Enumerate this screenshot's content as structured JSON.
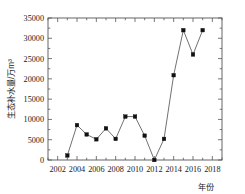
{
  "chart_data": {
    "type": "line",
    "title": "",
    "xlabel": "年份",
    "ylabel": "生态补水量/万m³",
    "x": [
      2003,
      2004,
      2005,
      2006,
      2007,
      2008,
      2009,
      2010,
      2011,
      2012,
      2013,
      2014,
      2015,
      2016,
      2017
    ],
    "values": [
      1100,
      8600,
      6300,
      5100,
      7800,
      5200,
      10700,
      10700,
      6000,
      0,
      5200,
      20900,
      32000,
      26000,
      32000
    ],
    "series": [
      {
        "name": "生态补水量",
        "values": [
          1100,
          8600,
          6300,
          5100,
          7800,
          5200,
          10700,
          10700,
          6000,
          0,
          5200,
          20900,
          32000,
          26000,
          32000
        ]
      }
    ],
    "xlim": [
      2001,
      2019
    ],
    "ylim": [
      0,
      35000
    ],
    "xticks": [
      2002,
      2004,
      2006,
      2008,
      2010,
      2012,
      2014,
      2016,
      2018
    ],
    "xtick_labels": [
      "2002",
      "2004",
      "2006",
      "2008",
      "2010",
      "2012",
      "2014",
      "2016",
      "2018"
    ],
    "yticks": [
      0,
      5000,
      10000,
      15000,
      20000,
      25000,
      30000,
      35000
    ],
    "ytick_labels": [
      "0",
      "5000",
      "10000",
      "15000",
      "20000",
      "25000",
      "30000",
      "35000"
    ],
    "x_minor_step": 1,
    "y_minor_step": 2500,
    "grid": false,
    "legend": false,
    "legend_position": "none",
    "marker": "square",
    "marker_color": "#111111",
    "line_color": "#4d4d4d",
    "background_color": "#ffffff",
    "axis_color": "#555555"
  }
}
